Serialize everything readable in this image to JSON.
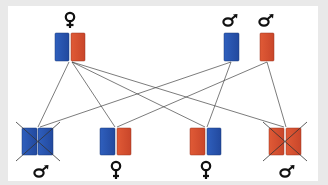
{
  "diagram": {
    "type": "sex-linked inheritance cross (Punnett-style)",
    "colors": {
      "blue_chromosome": "#2a57b0",
      "red_chromosome": "#d9512f",
      "line": "#444444",
      "background": "#e9e9e9",
      "panel": "#ffffff"
    },
    "parents": [
      {
        "id": "female-parent",
        "sex_symbol": "♀",
        "sex": "female",
        "chromosomes": [
          "blue",
          "red"
        ]
      },
      {
        "id": "male-parent-blue",
        "sex_symbol": "♂",
        "sex": "male",
        "chromosomes": [
          "blue"
        ]
      },
      {
        "id": "male-parent-red",
        "sex_symbol": "♂",
        "sex": "male",
        "chromosomes": [
          "red"
        ]
      }
    ],
    "offspring": [
      {
        "id": "offspring-1",
        "sex_symbol": "♂",
        "sex": "male",
        "chromosomes": [
          "blue",
          "blue"
        ],
        "crossed_out": true
      },
      {
        "id": "offspring-2",
        "sex_symbol": "♀",
        "sex": "female",
        "chromosomes": [
          "blue",
          "red"
        ],
        "crossed_out": false
      },
      {
        "id": "offspring-3",
        "sex_symbol": "♀",
        "sex": "female",
        "chromosomes": [
          "red",
          "blue"
        ],
        "crossed_out": false
      },
      {
        "id": "offspring-4",
        "sex_symbol": "♂",
        "sex": "male",
        "chromosomes": [
          "red",
          "red"
        ],
        "crossed_out": true
      }
    ],
    "connections": [
      [
        "female-parent",
        "offspring-1"
      ],
      [
        "female-parent",
        "offspring-2"
      ],
      [
        "female-parent",
        "offspring-3"
      ],
      [
        "female-parent",
        "offspring-4"
      ],
      [
        "male-parent-blue",
        "offspring-1"
      ],
      [
        "male-parent-blue",
        "offspring-3"
      ],
      [
        "male-parent-red",
        "offspring-2"
      ],
      [
        "male-parent-red",
        "offspring-4"
      ]
    ]
  }
}
